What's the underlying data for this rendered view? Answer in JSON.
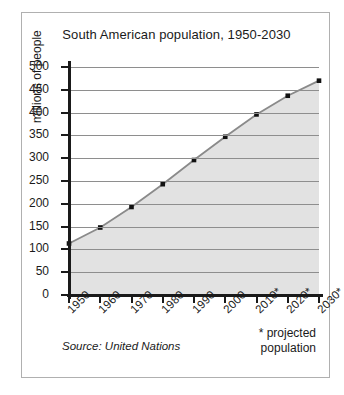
{
  "chart_data": {
    "type": "line",
    "title": "South American population, 1950-2030",
    "xlabel": "",
    "ylabel": "millions of people",
    "categories": [
      "1950",
      "1960",
      "1970",
      "1980",
      "1990",
      "2000",
      "2010*",
      "2020*",
      "2030*"
    ],
    "x_values": [
      1950,
      1960,
      1970,
      1980,
      1990,
      2000,
      2010,
      2020,
      2030
    ],
    "values": [
      113,
      148,
      193,
      243,
      296,
      347,
      396,
      437,
      470
    ],
    "ylim": [
      0,
      500
    ],
    "y_ticks": [
      0,
      50,
      100,
      150,
      200,
      250,
      300,
      350,
      400,
      450,
      500
    ],
    "grid": true,
    "legend": false,
    "area_fill": true,
    "marker": "square",
    "colors": {
      "line": "#8a8a8a",
      "marker": "#111111",
      "fill": "#e2e2e2",
      "grid": "#8e8e8e",
      "axis": "#1a1a1a",
      "border": "#b0b0b0",
      "text": "#1a1a1a"
    },
    "annotations": {
      "source": "Source: United Nations",
      "projection_note_line1": "* projected",
      "projection_note_line2": "population"
    }
  }
}
